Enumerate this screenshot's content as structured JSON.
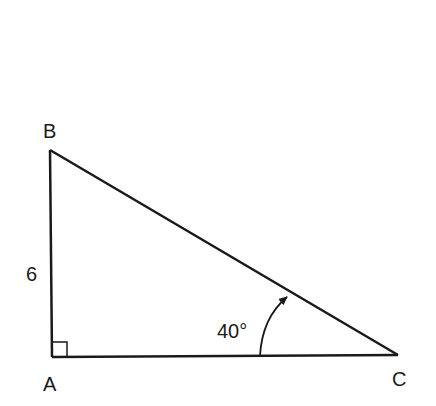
{
  "diagram": {
    "type": "right-triangle",
    "vertices": {
      "A": {
        "label": "A",
        "x": 52,
        "y": 357
      },
      "B": {
        "label": "B",
        "x": 50,
        "y": 150
      },
      "C": {
        "label": "C",
        "x": 398,
        "y": 355
      }
    },
    "side_AB_label": "6",
    "angle_C_label": "40°",
    "right_angle_at": "A",
    "stroke_color": "#1a1a1a"
  }
}
